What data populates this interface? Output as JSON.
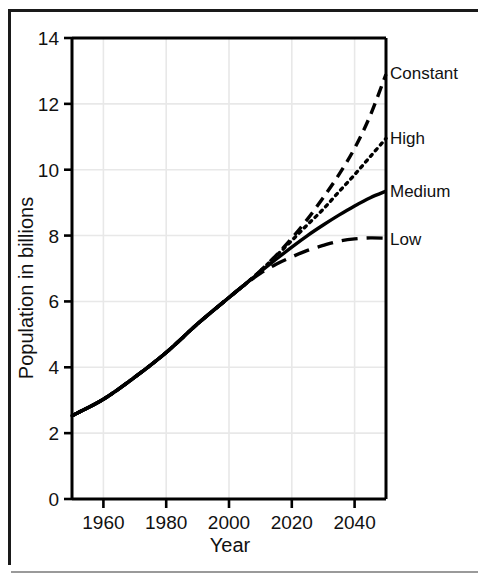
{
  "chart_data": {
    "type": "line",
    "title": "",
    "xlabel": "Year",
    "ylabel": "Population in billions",
    "xlim": [
      1950,
      2050
    ],
    "ylim": [
      0,
      14
    ],
    "xticks": [
      1960,
      1980,
      2000,
      2020,
      2040
    ],
    "xtick_labels": [
      "1960",
      "1980",
      "2000",
      "2020",
      "2040"
    ],
    "yticks": [
      0,
      2,
      4,
      6,
      8,
      10,
      12,
      14
    ],
    "ytick_labels": [
      "0",
      "2",
      "4",
      "6",
      "8",
      "10",
      "12",
      "14"
    ],
    "grid": true,
    "grid_color": "#e8e8e8",
    "legend_position": "right-inline-labels",
    "line_color": "#000000",
    "branch_year": 2005,
    "branch_value": 6.5,
    "series": [
      {
        "name": "Constant",
        "label": "Constant",
        "style": "dashed",
        "label_y_value": 12.95,
        "x": [
          1950,
          1960,
          1970,
          1980,
          1990,
          2000,
          2005,
          2010,
          2015,
          2020,
          2025,
          2030,
          2035,
          2040,
          2045,
          2050
        ],
        "values": [
          2.53,
          3.03,
          3.7,
          4.45,
          5.32,
          6.12,
          6.51,
          6.93,
          7.4,
          7.92,
          8.5,
          9.15,
          9.85,
          10.65,
          11.65,
          12.9
        ]
      },
      {
        "name": "High",
        "label": "High",
        "style": "dotted",
        "label_y_value": 10.95,
        "x": [
          1950,
          1960,
          1970,
          1980,
          1990,
          2000,
          2005,
          2010,
          2015,
          2020,
          2025,
          2030,
          2035,
          2040,
          2045,
          2050
        ],
        "values": [
          2.53,
          3.03,
          3.7,
          4.45,
          5.32,
          6.12,
          6.51,
          6.93,
          7.38,
          7.85,
          8.33,
          8.8,
          9.33,
          9.85,
          10.4,
          10.95
        ]
      },
      {
        "name": "Medium",
        "label": "Medium",
        "style": "solid",
        "label_y_value": 9.35,
        "x": [
          1950,
          1960,
          1970,
          1980,
          1990,
          2000,
          2005,
          2010,
          2015,
          2020,
          2025,
          2030,
          2035,
          2040,
          2045,
          2050
        ],
        "values": [
          2.53,
          3.03,
          3.7,
          4.45,
          5.32,
          6.12,
          6.51,
          6.9,
          7.28,
          7.65,
          8.0,
          8.32,
          8.62,
          8.9,
          9.15,
          9.35
        ]
      },
      {
        "name": "Low",
        "label": "Low",
        "style": "long-dashed",
        "label_y_value": 7.9,
        "x": [
          1950,
          1960,
          1970,
          1980,
          1990,
          2000,
          2005,
          2010,
          2015,
          2020,
          2025,
          2030,
          2035,
          2040,
          2045,
          2050
        ],
        "values": [
          2.53,
          3.03,
          3.7,
          4.45,
          5.32,
          6.12,
          6.51,
          6.85,
          7.13,
          7.35,
          7.55,
          7.7,
          7.83,
          7.9,
          7.93,
          7.92
        ]
      }
    ]
  },
  "axis": {
    "x_title": "Year",
    "y_title": "Population in billions"
  }
}
